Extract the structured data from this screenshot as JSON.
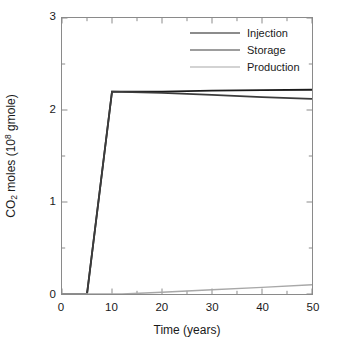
{
  "chart_data": {
    "type": "line",
    "title": "",
    "subtitle": "",
    "xlabel": "Time (years)",
    "ylabel": "CO2 moles (10^8 gmole)",
    "ylabel_parts": {
      "prefix": "CO",
      "sub": "2",
      "mid": " moles (10",
      "sup": "8",
      "suffix": " gmole)"
    },
    "xlim": [
      0,
      50
    ],
    "ylim": [
      0,
      3
    ],
    "xticks": [
      0,
      10,
      20,
      30,
      40,
      50
    ],
    "yticks": [
      0,
      1,
      2,
      3
    ],
    "xticks_minor": [
      5,
      15,
      25,
      35,
      45
    ],
    "yticks_minor": [
      0.5,
      1.5,
      2.5
    ],
    "xtick_labels": [
      "0",
      "10",
      "20",
      "30",
      "40",
      "50"
    ],
    "ytick_labels": [
      "0",
      "1",
      "2",
      "3"
    ],
    "grid": false,
    "legend_position": "upper right",
    "frame": "box",
    "series": [
      {
        "name": "Injection",
        "color": "#1a1a1a",
        "width": 1.8,
        "x": [
          0,
          5,
          10,
          20,
          30,
          40,
          50
        ],
        "y": [
          0,
          0,
          2.2,
          2.2,
          2.21,
          2.215,
          2.22
        ]
      },
      {
        "name": "Storage",
        "color": "#3c3c3c",
        "width": 1.8,
        "x": [
          0,
          5,
          10,
          20,
          30,
          40,
          50
        ],
        "y": [
          0,
          0,
          2.2,
          2.185,
          2.165,
          2.14,
          2.12
        ]
      },
      {
        "name": "Production",
        "color": "#a8a8a8",
        "width": 1.5,
        "x": [
          0,
          12,
          20,
          30,
          40,
          50
        ],
        "y": [
          0,
          0,
          0.018,
          0.045,
          0.072,
          0.1
        ]
      }
    ]
  },
  "legend": {
    "entries": [
      {
        "label": "Injection"
      },
      {
        "label": "Storage"
      },
      {
        "label": "Production"
      }
    ]
  },
  "axes": {
    "x_title": "Time (years)"
  }
}
